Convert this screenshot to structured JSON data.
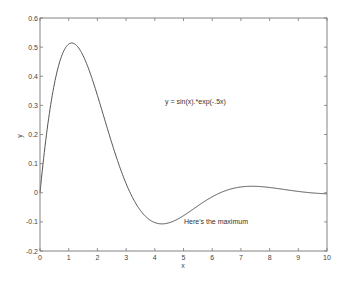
{
  "chart_data": {
    "type": "line",
    "title": "",
    "xlabel": "x",
    "ylabel": "y",
    "xlim": [
      0,
      10
    ],
    "ylim": [
      -0.2,
      0.6
    ],
    "grid": false,
    "x_ticks": [
      0,
      1,
      2,
      3,
      4,
      5,
      6,
      7,
      8,
      9,
      10
    ],
    "y_ticks": [
      -0.2,
      -0.1,
      0,
      0.1,
      0.2,
      0.3,
      0.4,
      0.5,
      0.6
    ],
    "y_tick_labels": [
      "-0.2",
      "-0.1",
      "0",
      "0.1",
      "0.2",
      "0.3",
      "0.4",
      "0.5",
      "0.6"
    ],
    "series": [
      {
        "name": "y = sin(x).*exp(-.5x)",
        "color": "#555555",
        "x": [
          0,
          0.5,
          1,
          1.1,
          1.5,
          2,
          2.5,
          3,
          3.5,
          4,
          4.3,
          4.5,
          5,
          5.5,
          6,
          6.5,
          7,
          7.4,
          7.5,
          8,
          8.5,
          9,
          9.5,
          10
        ],
        "values": [
          0,
          0.373,
          0.51,
          0.513,
          0.471,
          0.335,
          0.171,
          0.031,
          -0.061,
          -0.102,
          -0.107,
          -0.103,
          -0.079,
          -0.045,
          -0.014,
          0.008,
          0.02,
          0.023,
          0.022,
          0.018,
          0.011,
          0.005,
          -0.001,
          -0.005
        ]
      }
    ],
    "annotations": [
      {
        "text": "y = sin(x).*exp(-.5x)",
        "x": 5.1,
        "y": 0.345
      },
      {
        "text": "Here's the maximum",
        "x": 5.0,
        "y": -0.105
      }
    ]
  },
  "labels": {
    "x_axis": "x",
    "y_axis": "y",
    "formula": "y = sin(x).*exp(-.5x)",
    "note": "Here's the maximum"
  }
}
